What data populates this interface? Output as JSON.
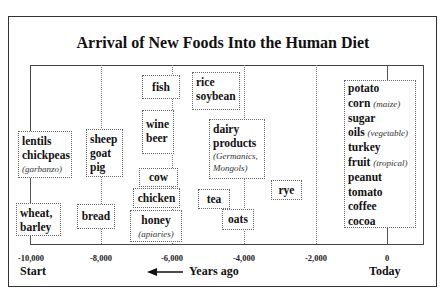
{
  "title": "Arrival of New Foods Into the Human Diet",
  "axis": {
    "ticks": [
      "-10,000",
      "-8,000",
      "-6,000",
      "-4,000",
      "-2,000",
      "0"
    ],
    "start_label": "Start",
    "end_label": "Today",
    "direction_label": "Years ago"
  },
  "boxes": {
    "lentils": {
      "lines": [
        "lentils",
        "chickpeas"
      ],
      "note": "(garbanzo)"
    },
    "wheat": {
      "lines": [
        "wheat,",
        "barley"
      ]
    },
    "sheep": {
      "lines": [
        "sheep",
        "goat",
        "pig"
      ]
    },
    "bread": {
      "lines": [
        "bread"
      ]
    },
    "fish": {
      "lines": [
        "fish"
      ]
    },
    "wine": {
      "lines": [
        "wine",
        "beer"
      ]
    },
    "cow": {
      "lines": [
        "cow"
      ]
    },
    "chicken": {
      "lines": [
        "chicken"
      ]
    },
    "honey": {
      "lines": [
        "honey"
      ],
      "note": "(apiaries)"
    },
    "rice": {
      "lines": [
        "rice",
        "soybean"
      ]
    },
    "dairy": {
      "lines": [
        "dairy",
        "products"
      ],
      "note1": "(Germanics,",
      "note2": "Mongols)"
    },
    "tea": {
      "lines": [
        "tea"
      ]
    },
    "oats": {
      "lines": [
        "oats"
      ]
    },
    "rye": {
      "lines": [
        "rye"
      ]
    },
    "modern": {
      "items": [
        {
          "name": "potato",
          "note": ""
        },
        {
          "name": "corn",
          "note": "(maize)"
        },
        {
          "name": "sugar",
          "note": ""
        },
        {
          "name": "oils",
          "note": "(vegetable)"
        },
        {
          "name": "turkey",
          "note": ""
        },
        {
          "name": "fruit",
          "note": "(tropical)"
        },
        {
          "name": "peanut",
          "note": ""
        },
        {
          "name": "tomato",
          "note": ""
        },
        {
          "name": "coffee",
          "note": ""
        },
        {
          "name": "cocoa",
          "note": ""
        }
      ]
    }
  }
}
